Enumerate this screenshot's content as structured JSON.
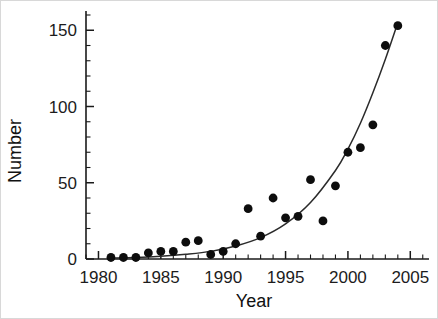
{
  "chart_data": {
    "type": "scatter",
    "title": "",
    "xlabel": "Year",
    "ylabel": "Number",
    "xlim": [
      1979,
      2006.5
    ],
    "ylim": [
      0,
      160
    ],
    "x_ticks_major": [
      1980,
      1985,
      1990,
      1995,
      2000,
      2005
    ],
    "x_tick_labels": [
      "1980",
      "1985",
      "1990",
      "1995",
      "2000",
      "2005"
    ],
    "x_tick_minor_step": 1,
    "y_ticks_major": [
      0,
      50,
      100,
      150
    ],
    "y_tick_labels": [
      "0",
      "50",
      "100",
      "150"
    ],
    "y_tick_minor_step": 10,
    "grid": false,
    "legend": null,
    "marker": "filled-circle",
    "marker_color": "#0d0d0d",
    "curve_color": "#2b2b2b",
    "x": [
      1981,
      1982,
      1983,
      1984,
      1985,
      1986,
      1987,
      1988,
      1989,
      1990,
      1991,
      1992,
      1993,
      1994,
      1995,
      1996,
      1997,
      1998,
      1999,
      2000,
      2001,
      2002,
      2003,
      2004
    ],
    "values": [
      1,
      1,
      1,
      4,
      5,
      5,
      11,
      12,
      3,
      5,
      10,
      33,
      15,
      40,
      27,
      28,
      52,
      25,
      48,
      70,
      73,
      88,
      140,
      153
    ],
    "series": [
      {
        "name": "observed",
        "type": "scatter",
        "x": [
          1981,
          1982,
          1983,
          1984,
          1985,
          1986,
          1987,
          1988,
          1989,
          1990,
          1991,
          1992,
          1993,
          1994,
          1995,
          1996,
          1997,
          1998,
          1999,
          2000,
          2001,
          2002,
          2003,
          2004
        ],
        "values": [
          1,
          1,
          1,
          4,
          5,
          5,
          11,
          12,
          3,
          5,
          10,
          33,
          15,
          40,
          27,
          28,
          52,
          25,
          48,
          70,
          73,
          88,
          140,
          153
        ]
      },
      {
        "name": "fitted-exponential-curve",
        "type": "line",
        "x": [
          1981,
          1983,
          1985,
          1987,
          1989,
          1991,
          1993,
          1995,
          1997,
          1999,
          2000,
          2001,
          2002,
          2003,
          2004
        ],
        "values": [
          0.6,
          1.0,
          1.8,
          3.1,
          5.0,
          8.5,
          14.0,
          23.0,
          37.0,
          58.0,
          72.0,
          89.0,
          109.0,
          131.0,
          155.0
        ]
      }
    ]
  },
  "axes": {
    "y_title": "Number",
    "x_title": "Year"
  }
}
